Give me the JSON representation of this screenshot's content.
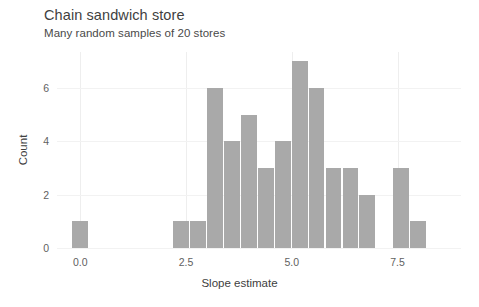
{
  "chart_data": {
    "type": "bar",
    "title": "Chain sandwich store",
    "subtitle": "Many random samples of 20 stores",
    "xlabel": "Slope estimate",
    "ylabel": "Count",
    "xlim": [
      -0.55,
      9.0
    ],
    "ylim": [
      0,
      7.35
    ],
    "xticks": [
      0.0,
      2.5,
      5.0,
      7.5
    ],
    "xtick_labels": [
      "0.0",
      "2.5",
      "5.0",
      "7.5"
    ],
    "yticks": [
      0,
      2,
      4,
      6
    ],
    "ytick_labels": [
      "0",
      "2",
      "4",
      "6"
    ],
    "grid": true,
    "legend": "none",
    "bar_color": "#a9a9a9",
    "bin_width": 0.4,
    "bins": [
      {
        "left": -0.2,
        "right": 0.2,
        "center": 0.0,
        "count": 1
      },
      {
        "left": 2.2,
        "right": 2.6,
        "center": 2.4,
        "count": 1
      },
      {
        "left": 2.6,
        "right": 3.0,
        "center": 2.8,
        "count": 1
      },
      {
        "left": 3.0,
        "right": 3.4,
        "center": 3.2,
        "count": 6
      },
      {
        "left": 3.4,
        "right": 3.8,
        "center": 3.6,
        "count": 4
      },
      {
        "left": 3.8,
        "right": 4.2,
        "center": 4.0,
        "count": 5
      },
      {
        "left": 4.2,
        "right": 4.6,
        "center": 4.4,
        "count": 3
      },
      {
        "left": 4.6,
        "right": 5.0,
        "center": 4.8,
        "count": 4
      },
      {
        "left": 5.0,
        "right": 5.4,
        "center": 5.2,
        "count": 7
      },
      {
        "left": 5.4,
        "right": 5.8,
        "center": 5.6,
        "count": 6
      },
      {
        "left": 5.8,
        "right": 6.2,
        "center": 6.0,
        "count": 3
      },
      {
        "left": 6.2,
        "right": 6.6,
        "center": 6.4,
        "count": 3
      },
      {
        "left": 6.6,
        "right": 7.0,
        "center": 6.8,
        "count": 2
      },
      {
        "left": 7.4,
        "right": 7.8,
        "center": 7.6,
        "count": 3
      },
      {
        "left": 7.8,
        "right": 8.2,
        "center": 8.0,
        "count": 1
      }
    ]
  }
}
